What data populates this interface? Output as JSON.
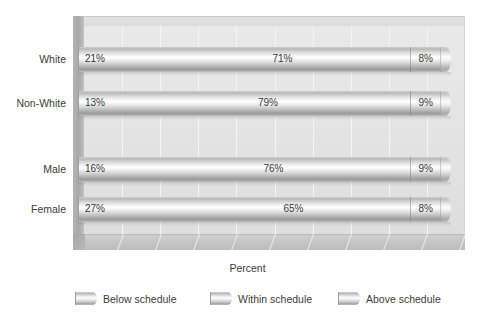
{
  "chart_data": {
    "type": "bar",
    "subtype": "stacked-horizontal-100-percent-cylinder-3d",
    "title": "",
    "xlabel": "Percent",
    "ylabel": "",
    "xlim": [
      0,
      100
    ],
    "grid": true,
    "gridline_count": 10,
    "legend_position": "bottom",
    "categories": [
      "White",
      "Non-White",
      "Male",
      "Female"
    ],
    "series": [
      {
        "name": "Below schedule",
        "values": [
          21,
          13,
          16,
          27
        ]
      },
      {
        "name": "Within schedule",
        "values": [
          71,
          79,
          76,
          65
        ]
      },
      {
        "name": "Above schedule",
        "values": [
          8,
          9,
          9,
          8
        ]
      }
    ],
    "data_labels": [
      {
        "category": "White",
        "below": "21%",
        "within": "71%",
        "above": "8%"
      },
      {
        "category": "Non-White",
        "below": "13%",
        "within": "79%",
        "above": "9%"
      },
      {
        "category": "Male",
        "below": "16%",
        "within": "76%",
        "above": "9%"
      },
      {
        "category": "Female",
        "below": "27%",
        "within": "65%",
        "above": "8%"
      }
    ],
    "colors": {
      "plot_background": "#e6e6e6",
      "floor": "#c4c4c4",
      "wall_left": "#aeaeae",
      "bar_light": "#ffffff",
      "bar_dark": "#9b9b9b",
      "text": "#3a3a3a",
      "gridline": "#f4f4f4"
    }
  },
  "axis": {
    "x_title": "Percent"
  },
  "rows": [
    {
      "label": "White",
      "below": "21%",
      "within": "71%",
      "above": "8%"
    },
    {
      "label": "Non-White",
      "below": "13%",
      "within": "79%",
      "above": "9%"
    },
    {
      "label": "Male",
      "below": "16%",
      "within": "76%",
      "above": "9%"
    },
    {
      "label": "Female",
      "below": "27%",
      "within": "65%",
      "above": "8%"
    }
  ],
  "legend": {
    "items": [
      {
        "label": "Below schedule"
      },
      {
        "label": "Within schedule"
      },
      {
        "label": "Above schedule"
      }
    ]
  }
}
